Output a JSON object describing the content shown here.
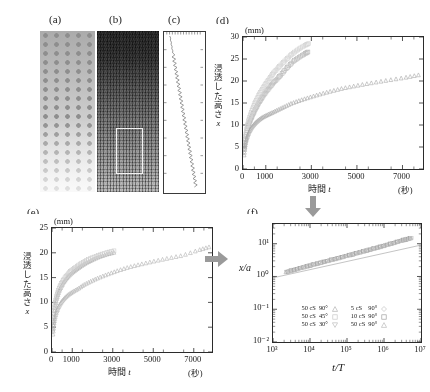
{
  "figure": {
    "panels": [
      {
        "id": "a",
        "label": "(a)",
        "kind": "photograph"
      },
      {
        "id": "b",
        "label": "(b)",
        "kind": "photograph"
      },
      {
        "id": "c",
        "label": "(c)",
        "kind": "trace"
      },
      {
        "id": "d",
        "label": "(d)",
        "kind": "chart"
      },
      {
        "id": "e",
        "label": "(e)",
        "kind": "chart"
      },
      {
        "id": "f",
        "label": "(f)",
        "kind": "chart"
      }
    ],
    "arrows": [
      {
        "name": "arrow-d-to-f",
        "direction": "down"
      },
      {
        "name": "arrow-e-to-f",
        "direction": "right"
      }
    ]
  },
  "chart_data": [
    {
      "type": "scatter",
      "panel": "(d)",
      "title": "",
      "xlabel": "時間 t",
      "ylabel": "浸透した高さ x",
      "xunit": "(秒)",
      "yunit": "(mm)",
      "xlim": [
        0,
        7900
      ],
      "ylim": [
        0,
        30
      ],
      "xticks": [
        0,
        1000,
        3000,
        5000,
        7000
      ],
      "xticklabels": [
        "0",
        "1000",
        "3000",
        "5000",
        "7000"
      ],
      "yticks": [
        0,
        5,
        10,
        15,
        20,
        25,
        30
      ],
      "yticklabels": [
        "0",
        "5",
        "10",
        "15",
        "20",
        "25",
        "30"
      ],
      "grid": false,
      "legend": "none",
      "series": [
        {
          "name": "50 cS 30°",
          "marker": "square-open",
          "color": "#b9b9b9",
          "x": [
            60,
            110,
            170,
            240,
            320,
            410,
            510,
            620,
            740,
            870,
            1010,
            1160,
            1320,
            1490,
            1670,
            1860,
            2060,
            2270,
            2490,
            2720,
            2850
          ],
          "y": [
            4.6,
            7.0,
            8.6,
            9.9,
            11.0,
            12.1,
            13.2,
            14.3,
            15.4,
            16.5,
            17.5,
            18.5,
            19.5,
            20.4,
            21.4,
            22.6,
            23.7,
            24.7,
            25.5,
            26.2,
            26.6
          ]
        },
        {
          "name": "50 cS 45°",
          "marker": "square-open",
          "color": "#d2d2d2",
          "x": [
            60,
            110,
            170,
            240,
            320,
            410,
            510,
            620,
            740,
            870,
            1010,
            1160,
            1320,
            1490,
            1670,
            1860,
            2060,
            2270,
            2490,
            2720,
            2880
          ],
          "y": [
            5.0,
            7.6,
            9.4,
            10.9,
            12.2,
            13.5,
            14.8,
            16.0,
            17.2,
            18.4,
            19.5,
            20.6,
            21.7,
            22.7,
            23.7,
            24.7,
            25.7,
            26.6,
            27.4,
            28.1,
            28.5
          ]
        },
        {
          "name": "50 cS 90°",
          "marker": "triangle-open",
          "color": "#a8a8a8",
          "x": [
            50,
            90,
            140,
            210,
            300,
            410,
            540,
            690,
            860,
            1050,
            1260,
            1500,
            1780,
            2100,
            2480,
            2900,
            3350,
            3850,
            4400,
            5000,
            5650,
            6350,
            7100,
            7700
          ],
          "y": [
            3.2,
            5.2,
            6.6,
            7.7,
            8.8,
            9.7,
            10.5,
            11.2,
            11.8,
            12.3,
            12.8,
            13.4,
            14.1,
            14.9,
            15.6,
            16.3,
            17.0,
            17.7,
            18.4,
            19.0,
            19.6,
            20.2,
            20.8,
            21.4
          ]
        }
      ]
    },
    {
      "type": "scatter",
      "panel": "(e)",
      "title": "",
      "xlabel": "時間 t",
      "ylabel": "浸透した高さ x",
      "xunit": "(秒)",
      "yunit": "(mm)",
      "xlim": [
        0,
        7900
      ],
      "ylim": [
        0,
        25
      ],
      "xticks": [
        0,
        1000,
        3000,
        5000,
        7000
      ],
      "xticklabels": [
        "0",
        "1000",
        "3000",
        "5000",
        "7000"
      ],
      "yticks": [
        0,
        5,
        10,
        15,
        20,
        25
      ],
      "yticklabels": [
        "0",
        "5",
        "10",
        "15",
        "20",
        "25"
      ],
      "grid": false,
      "legend": "none",
      "series": [
        {
          "name": "50 cS 30°",
          "marker": "triangle-open",
          "color": "#aaaaaa",
          "x": [
            50,
            90,
            150,
            230,
            330,
            450,
            590,
            760,
            950,
            1170,
            1410,
            1680,
            1980,
            2310,
            2670,
            3050
          ],
          "y": [
            4.6,
            7.4,
            9.3,
            10.8,
            12.1,
            13.2,
            14.2,
            15.1,
            15.9,
            16.6,
            17.3,
            18.0,
            18.6,
            19.2,
            19.7,
            20.1
          ]
        },
        {
          "name": "50 cS 45°",
          "marker": "square-open",
          "color": "#cdcdcd",
          "x": [
            50,
            90,
            150,
            230,
            330,
            450,
            590,
            760,
            950,
            1170,
            1410,
            1680,
            1980,
            2310,
            2670,
            3060
          ],
          "y": [
            5.2,
            8.0,
            9.9,
            11.3,
            12.6,
            13.7,
            14.7,
            15.6,
            16.4,
            17.1,
            17.8,
            18.4,
            19.0,
            19.5,
            20.0,
            20.4
          ]
        },
        {
          "name": "50 cS 90°",
          "marker": "triangle-open",
          "color": "#b2b2b2",
          "x": [
            50,
            90,
            150,
            230,
            330,
            460,
            620,
            810,
            1030,
            1290,
            1580,
            1920,
            2300,
            2740,
            3220,
            3760,
            4350,
            5000,
            5700,
            6450,
            7250,
            7750
          ],
          "y": [
            3.6,
            5.6,
            7.0,
            8.2,
            9.2,
            10.1,
            10.9,
            11.6,
            12.2,
            12.8,
            13.6,
            14.3,
            15.0,
            15.7,
            16.4,
            17.1,
            17.7,
            18.3,
            18.9,
            19.5,
            20.6,
            21.2
          ]
        }
      ]
    },
    {
      "type": "scatter",
      "panel": "(f)",
      "title": "",
      "xlabel": "t/T",
      "ylabel": "x/a",
      "xscale": "log",
      "yscale": "log",
      "xlim": [
        1000,
        10000000
      ],
      "ylim": [
        0.01,
        40
      ],
      "xticks": [
        1000,
        10000,
        100000,
        1000000,
        10000000
      ],
      "xticklabels": [
        "10³",
        "10⁴",
        "10⁵",
        "10⁶",
        "10⁷"
      ],
      "yticks": [
        0.01,
        0.1,
        1,
        10
      ],
      "yticklabels": [
        "10⁻²",
        "10⁻¹",
        "10⁰",
        "10¹"
      ],
      "grid": false,
      "legend_position": "lower-center",
      "fit_line": {
        "name": "power-law-fit",
        "slope": 0.25,
        "color": "#aaaaaa"
      },
      "legend_entries": [
        {
          "fluid": "50 cS",
          "angle": "90°",
          "marker": "triangle-open",
          "color": "#b4b4b4"
        },
        {
          "fluid": "50 cS",
          "angle": "45°",
          "marker": "square-open",
          "color": "#c8c8c8"
        },
        {
          "fluid": "50 cS",
          "angle": "30°",
          "marker": "triangle-down-open",
          "color": "#bdbdbd"
        },
        {
          "fluid": "5 cS",
          "angle": "90°",
          "marker": "diamond-open",
          "color": "#c2c2c2"
        },
        {
          "fluid": "10 cS",
          "angle": "90°",
          "marker": "square-open",
          "color": "#9f9f9f"
        },
        {
          "fluid": "50 cS",
          "angle": "90°",
          "marker": "triangle-open",
          "color": "#bcbcbc"
        }
      ],
      "collapsed_curve": {
        "x": [
          2200,
          5000,
          12000,
          30000,
          80000,
          200000,
          500000,
          1200000,
          3000000,
          5500000
        ],
        "y": [
          1.35,
          1.75,
          2.3,
          3.0,
          4.0,
          5.3,
          7.0,
          9.2,
          12.5,
          15.0
        ]
      }
    }
  ],
  "legend_text": {
    "rows": [
      {
        "left_fluid": "50 cS",
        "left_angle": "90°",
        "right_fluid": "5 cS",
        "right_angle": "90°"
      },
      {
        "left_fluid": "50 cS",
        "left_angle": "45°",
        "right_fluid": "10 cS",
        "right_angle": "90°"
      },
      {
        "left_fluid": "50 cS",
        "left_angle": "30°",
        "right_fluid": "50 cS",
        "right_angle": "90°"
      }
    ]
  },
  "axis_text": {
    "mm": "(mm)",
    "byou": "(秒)",
    "time_t": "時間 t",
    "height_x": "浸透した高さ x",
    "x_over_a": "x/a",
    "t_over_T": "t/T"
  }
}
